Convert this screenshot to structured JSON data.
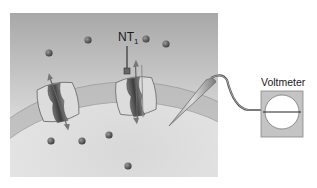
{
  "diagram": {
    "type": "neuron-membrane-voltmeter",
    "labels": {
      "neurotransmitter": "NT",
      "neurotransmitter_subscript": "1",
      "instrument": "Voltmeter"
    },
    "elements": [
      {
        "name": "extracellular-space",
        "description": "gray gradient panel"
      },
      {
        "name": "cell-membrane",
        "description": "curved lipid bilayer"
      },
      {
        "name": "ion-channel-left",
        "description": "channel with bidirectional arrows"
      },
      {
        "name": "ion-channel-ligand-gated",
        "description": "channel with NT1 bound, bidirectional arrows"
      },
      {
        "name": "microelectrode",
        "description": "tapered electrode inserted through membrane"
      },
      {
        "name": "voltmeter",
        "description": "meter with circular dial and horizontal needle"
      },
      {
        "name": "ions",
        "count": 9
      }
    ],
    "colors": {
      "panel_top": "#a9a9a9",
      "panel_bottom": "#f0f0f0",
      "membrane": "#c8c8c8",
      "cell_interior": "#e4e4e4",
      "ion": "#555555",
      "channel_fill": "#dcdcdc",
      "channel_core": "#5a5a5a",
      "voltmeter_case": "#c4c4c4",
      "dial": "#ffffff"
    }
  }
}
